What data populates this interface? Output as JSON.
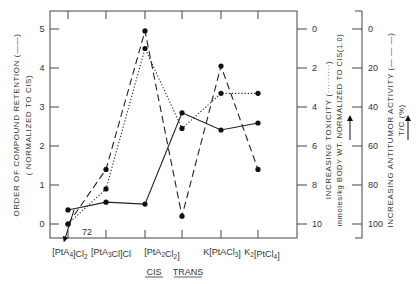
{
  "chart_data": {
    "type": "line",
    "title": "",
    "categories": [
      "[PtA4]Cl2",
      "[PtA3Cl]Cl",
      "[PtA2Cl2] CIS",
      "[PtA2Cl2] TRANS",
      "K[PtACl3]",
      "K2[PtCl4]"
    ],
    "category_labels": [
      {
        "main": "[PtA",
        "sub": "4",
        "tail": "]Cl",
        "sub2": "2"
      },
      {
        "main": "[PtA",
        "sub": "3",
        "tail": "Cl]Cl",
        "sub2": ""
      },
      {
        "main": "[PtA",
        "sub": "2",
        "tail": "Cl",
        "sub2": "2",
        "close": "]"
      },
      {
        "main": "",
        "sub": "",
        "tail": "",
        "sub2": ""
      },
      {
        "main": "K[PtACl",
        "sub": "3",
        "tail": "]",
        "sub2": ""
      },
      {
        "main": "K",
        "sub": "2",
        "tail": "[PtCl",
        "sub2": "4",
        "close": "]"
      }
    ],
    "isomer_labels": {
      "cis": "CIS",
      "trans": "TRANS"
    },
    "series": [
      {
        "name": "Order of compound retention (normalized to CIS)",
        "style": "solid",
        "axis": "left",
        "values": [
          0.36,
          0.56,
          0.51,
          2.85,
          2.41,
          2.59
        ]
      },
      {
        "name": "Increasing toxicity (mmoles/kg body wt. normalized to CIS (1.0))",
        "style": "dotted",
        "axis": "right1",
        "values": [
          10,
          8.2,
          1.0,
          5.1,
          3.3,
          3.3
        ],
        "annotation": {
          "index": 0,
          "text": "72",
          "note": "arrow pointing off-scale downward"
        }
      },
      {
        "name": "Increasing antitumor activity T/C (%)",
        "style": "dashed",
        "axis": "right2",
        "values": [
          100,
          72,
          1,
          96,
          19,
          72
        ]
      }
    ],
    "axes": {
      "left": {
        "label": "ORDER OF COMPOUND RETENTION (——)",
        "sublabel": "( NORMALIZED TO CIS)",
        "ticks": [
          "0",
          "1",
          "2",
          "3",
          "4",
          "5"
        ],
        "range": [
          0,
          5
        ]
      },
      "right1": {
        "label": "INCREASING TOXICITY (·········)",
        "sublabel": "mmoles/kg BODY WT. NORMALIZED TO CIS(1.0)",
        "ticks": [
          "0",
          "2",
          "4",
          "6",
          "8",
          "10"
        ],
        "range": [
          0,
          10
        ],
        "inverted": true
      },
      "right2": {
        "label": "INCREASING ANTITUMOR ACTIVITY (— — —)",
        "sublabel": "T/C (%)",
        "ticks": [
          "0",
          "20",
          "40",
          "60",
          "80",
          "100"
        ],
        "range": [
          0,
          100
        ],
        "inverted": true
      }
    },
    "grid": false,
    "legend": "none (series described in axis labels)"
  }
}
